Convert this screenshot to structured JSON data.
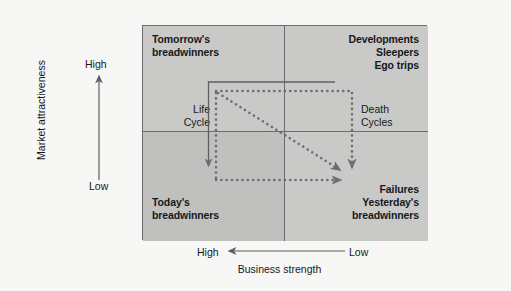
{
  "figure": {
    "background_color": "#f7f7f5",
    "cell_color": "#c9c9c7",
    "cell_color_dark": "#c0c0be",
    "line_color": "#6b6b6b",
    "text_color": "#15181c"
  },
  "axes": {
    "y": {
      "title": "Market attractiveness",
      "high_label": "High",
      "low_label": "Low",
      "direction": "up"
    },
    "x": {
      "title": "Business strength",
      "high_label": "High",
      "low_label": "Low",
      "direction": "left"
    }
  },
  "quadrants": [
    {
      "key": "top_left",
      "label": "Tomorrow's\nbreadwinners",
      "align": "left"
    },
    {
      "key": "top_right",
      "label": "Developments\nSleepers\nEgo trips",
      "align": "right"
    },
    {
      "key": "bottom_left",
      "label": "Today's\nbreadwinners",
      "align": "left"
    },
    {
      "key": "bottom_right",
      "label": "Failures\nYesterday's\nbreadwinners",
      "align": "right"
    }
  ],
  "annotations": [
    {
      "key": "life_cycle",
      "label": "Life\nCycle",
      "style": "solid-arrow"
    },
    {
      "key": "death_cycle",
      "label": "Death\nCycles",
      "style": "dotted-arrow"
    }
  ],
  "flows": [
    {
      "key": "life-cycle-path",
      "style": "solid",
      "note": "Top-right to left then down into Today's breadwinners"
    },
    {
      "key": "death-cycle-top",
      "style": "dotted",
      "note": "Top edge left to right"
    },
    {
      "key": "death-cycle-right",
      "style": "dotted",
      "note": "Right edge down to Failures"
    },
    {
      "key": "death-cycle-left",
      "style": "dotted",
      "note": "Left edge down"
    },
    {
      "key": "death-cycle-bottom",
      "style": "dotted",
      "note": "Bottom edge left to right into Failures"
    },
    {
      "key": "death-cycle-diagonal",
      "style": "dotted",
      "note": "Diagonal from top-left corner through centre to Failures"
    }
  ]
}
